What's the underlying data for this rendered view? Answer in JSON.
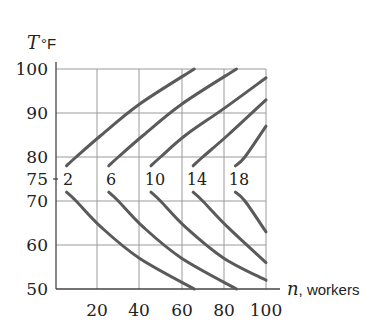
{
  "chart_data": {
    "type": "line",
    "title": "",
    "xlabel": "n, workers",
    "ylabel": "T°F",
    "xlim": [
      0,
      100
    ],
    "ylim": [
      50,
      100
    ],
    "grid": true,
    "legend": "inline curve labels at T = 75",
    "x_ticks": [
      20,
      40,
      60,
      80,
      100
    ],
    "y_ticks": [
      50,
      60,
      70,
      75,
      80,
      90,
      100
    ],
    "series": [
      {
        "name": "2",
        "label": "2",
        "vertex": {
          "n": 5,
          "T": 75
        },
        "points": [
          [
            66,
            100
          ],
          [
            40,
            92
          ],
          [
            22,
            85
          ],
          [
            10,
            80
          ],
          [
            5,
            75
          ],
          [
            10,
            70
          ],
          [
            22,
            64
          ],
          [
            40,
            57
          ],
          [
            66,
            50
          ]
        ]
      },
      {
        "name": "6",
        "label": "6",
        "vertex": {
          "n": 25,
          "T": 75
        },
        "points": [
          [
            86,
            100
          ],
          [
            60,
            92
          ],
          [
            42,
            85
          ],
          [
            30,
            80
          ],
          [
            25,
            75
          ],
          [
            30,
            70
          ],
          [
            42,
            64
          ],
          [
            60,
            57
          ],
          [
            86,
            50
          ]
        ]
      },
      {
        "name": "10",
        "label": "10",
        "vertex": {
          "n": 45,
          "T": 75
        },
        "points": [
          [
            100,
            98
          ],
          [
            80,
            91
          ],
          [
            62,
            85
          ],
          [
            50,
            80
          ],
          [
            45,
            75
          ],
          [
            50,
            70
          ],
          [
            62,
            64
          ],
          [
            80,
            57
          ],
          [
            100,
            52
          ]
        ]
      },
      {
        "name": "14",
        "label": "14",
        "vertex": {
          "n": 65,
          "T": 75
        },
        "points": [
          [
            100,
            93
          ],
          [
            82,
            85
          ],
          [
            70,
            80
          ],
          [
            65,
            75
          ],
          [
            70,
            70
          ],
          [
            82,
            64
          ],
          [
            100,
            56
          ]
        ]
      },
      {
        "name": "18",
        "label": "18",
        "vertex": {
          "n": 85,
          "T": 75
        },
        "points": [
          [
            100,
            87
          ],
          [
            90,
            80
          ],
          [
            85,
            75
          ],
          [
            90,
            70
          ],
          [
            100,
            63
          ]
        ]
      }
    ]
  },
  "axes": {
    "y_title_var": "T",
    "y_title_unit": "°F",
    "x_title_var": "n",
    "x_title_rest": ", workers",
    "y_tick_labels": [
      "100",
      "90",
      "80",
      "75",
      "70",
      "60",
      "50"
    ],
    "x_tick_labels": [
      "20",
      "40",
      "60",
      "80",
      "100"
    ]
  },
  "curve_labels": [
    "2",
    "6",
    "10",
    "14",
    "18"
  ],
  "colors": {
    "curve": "#5a5a5a",
    "grid": "#9a9a9a",
    "axis": "#444444",
    "text": "#222222"
  }
}
